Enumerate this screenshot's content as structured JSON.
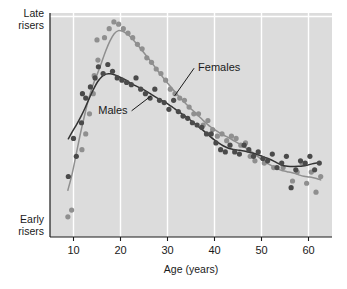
{
  "chart_data": {
    "type": "scatter",
    "title": "",
    "subtitle": "",
    "xlabel": "Age (years)",
    "ylabel": "",
    "xlim": [
      5,
      65
    ],
    "ylim": [
      0,
      100
    ],
    "xticks": [
      10,
      20,
      30,
      40,
      50,
      60
    ],
    "xticklabels": [
      "10",
      "20",
      "30",
      "40",
      "50",
      "60"
    ],
    "yticks": [],
    "yticklabels": [],
    "y_axis_top_label_line1": "Late",
    "y_axis_top_label_line2": "risers",
    "y_axis_bottom_label_line1": "Early",
    "y_axis_bottom_label_line2": "risers",
    "grid": "vertical-white-gridlines-at-xticks plus one horizontal gridline near top",
    "legend_position": "inline-annotations",
    "plot_background": "#dcdcdc",
    "gridline_color": "#ffffff",
    "axis_color": "#1a1a1a",
    "annotations": [
      {
        "name": "Females",
        "text": "Females",
        "x": 36.5,
        "y": 74,
        "leader_to_x": 31.5,
        "leader_to_y": 63
      },
      {
        "name": "Males",
        "text": "Males",
        "x": 21.5,
        "y": 55,
        "leader_to_x": 26.5,
        "leader_to_y": 63
      }
    ],
    "series": [
      {
        "name": "Females",
        "color": "#8f8f8f",
        "marker": "circle",
        "fit_curve_color": "#8f8f8f",
        "points": [
          {
            "x": 8.8,
            "y": 9
          },
          {
            "x": 9.6,
            "y": 12
          },
          {
            "x": 11.8,
            "y": 39
          },
          {
            "x": 12.6,
            "y": 46
          },
          {
            "x": 13.4,
            "y": 55
          },
          {
            "x": 14.2,
            "y": 64
          },
          {
            "x": 14.4,
            "y": 72
          },
          {
            "x": 15.2,
            "y": 79
          },
          {
            "x": 15.0,
            "y": 88
          },
          {
            "x": 16.6,
            "y": 89
          },
          {
            "x": 17.6,
            "y": 93
          },
          {
            "x": 18.6,
            "y": 96
          },
          {
            "x": 19.6,
            "y": 95
          },
          {
            "x": 20.6,
            "y": 93
          },
          {
            "x": 21.6,
            "y": 91
          },
          {
            "x": 22.6,
            "y": 89
          },
          {
            "x": 23.6,
            "y": 86
          },
          {
            "x": 24.6,
            "y": 84
          },
          {
            "x": 25.6,
            "y": 80
          },
          {
            "x": 26.6,
            "y": 78
          },
          {
            "x": 27.6,
            "y": 75
          },
          {
            "x": 28.6,
            "y": 73
          },
          {
            "x": 29.6,
            "y": 70
          },
          {
            "x": 30.6,
            "y": 66
          },
          {
            "x": 31.6,
            "y": 64
          },
          {
            "x": 32.6,
            "y": 62
          },
          {
            "x": 33.6,
            "y": 61
          },
          {
            "x": 34.6,
            "y": 58
          },
          {
            "x": 35.6,
            "y": 55
          },
          {
            "x": 36.6,
            "y": 55
          },
          {
            "x": 37.6,
            "y": 50
          },
          {
            "x": 38.6,
            "y": 52
          },
          {
            "x": 39.6,
            "y": 48
          },
          {
            "x": 40.6,
            "y": 45
          },
          {
            "x": 41.6,
            "y": 46
          },
          {
            "x": 42.6,
            "y": 43
          },
          {
            "x": 43.6,
            "y": 45
          },
          {
            "x": 44.6,
            "y": 44
          },
          {
            "x": 45.6,
            "y": 41
          },
          {
            "x": 46.6,
            "y": 42
          },
          {
            "x": 47.6,
            "y": 36
          },
          {
            "x": 48.6,
            "y": 34
          },
          {
            "x": 50.6,
            "y": 33
          },
          {
            "x": 52.6,
            "y": 31
          },
          {
            "x": 54.6,
            "y": 31
          },
          {
            "x": 56.6,
            "y": 25
          },
          {
            "x": 57.6,
            "y": 29
          },
          {
            "x": 58.6,
            "y": 33
          },
          {
            "x": 59.6,
            "y": 24
          },
          {
            "x": 60.6,
            "y": 29
          },
          {
            "x": 61.6,
            "y": 20
          },
          {
            "x": 62.6,
            "y": 27
          }
        ],
        "peak_age": 19.5,
        "peak_value": 96
      },
      {
        "name": "Males",
        "color": "#4a4a4a",
        "marker": "circle",
        "fit_curve_color": "#333333",
        "points": [
          {
            "x": 8.9,
            "y": 27
          },
          {
            "x": 10.6,
            "y": 36
          },
          {
            "x": 10.0,
            "y": 44
          },
          {
            "x": 11.7,
            "y": 51
          },
          {
            "x": 12.6,
            "y": 62
          },
          {
            "x": 11.9,
            "y": 64
          },
          {
            "x": 13.6,
            "y": 67
          },
          {
            "x": 14.6,
            "y": 71
          },
          {
            "x": 15.3,
            "y": 76
          },
          {
            "x": 16.3,
            "y": 73
          },
          {
            "x": 17.3,
            "y": 77
          },
          {
            "x": 18.3,
            "y": 74
          },
          {
            "x": 19.3,
            "y": 71
          },
          {
            "x": 20.3,
            "y": 70
          },
          {
            "x": 21.3,
            "y": 69
          },
          {
            "x": 22.3,
            "y": 68
          },
          {
            "x": 23.3,
            "y": 71
          },
          {
            "x": 24.3,
            "y": 66
          },
          {
            "x": 25.3,
            "y": 64
          },
          {
            "x": 26.3,
            "y": 62
          },
          {
            "x": 27.3,
            "y": 66
          },
          {
            "x": 28.3,
            "y": 61
          },
          {
            "x": 29.3,
            "y": 60
          },
          {
            "x": 30.3,
            "y": 57
          },
          {
            "x": 31.3,
            "y": 61
          },
          {
            "x": 32.3,
            "y": 56
          },
          {
            "x": 33.3,
            "y": 54
          },
          {
            "x": 34.3,
            "y": 53
          },
          {
            "x": 35.3,
            "y": 51
          },
          {
            "x": 36.3,
            "y": 50
          },
          {
            "x": 37.3,
            "y": 49
          },
          {
            "x": 38.3,
            "y": 46
          },
          {
            "x": 39.3,
            "y": 46
          },
          {
            "x": 40.3,
            "y": 42
          },
          {
            "x": 41.3,
            "y": 39
          },
          {
            "x": 42.3,
            "y": 38
          },
          {
            "x": 43.3,
            "y": 41
          },
          {
            "x": 44.3,
            "y": 38
          },
          {
            "x": 45.3,
            "y": 37
          },
          {
            "x": 46.3,
            "y": 41
          },
          {
            "x": 47.3,
            "y": 39
          },
          {
            "x": 48.3,
            "y": 36
          },
          {
            "x": 49.3,
            "y": 38
          },
          {
            "x": 50.3,
            "y": 35
          },
          {
            "x": 51.3,
            "y": 34
          },
          {
            "x": 52.3,
            "y": 37
          },
          {
            "x": 53.3,
            "y": 31
          },
          {
            "x": 54.3,
            "y": 33
          },
          {
            "x": 55.3,
            "y": 36
          },
          {
            "x": 56.3,
            "y": 22
          },
          {
            "x": 57.3,
            "y": 30
          },
          {
            "x": 58.3,
            "y": 34
          },
          {
            "x": 59.3,
            "y": 33
          },
          {
            "x": 60.3,
            "y": 36
          },
          {
            "x": 61.3,
            "y": 30
          },
          {
            "x": 62.3,
            "y": 33
          }
        ],
        "peak_age": 17,
        "peak_value": 78
      }
    ]
  },
  "axis": {
    "xlabel": "Age (years)",
    "xticklabels": [
      "10",
      "20",
      "30",
      "40",
      "50",
      "60"
    ],
    "late_risers_line1": "Late",
    "late_risers_line2": "risers",
    "early_risers_line1": "Early",
    "early_risers_line2": "risers"
  },
  "annotations": {
    "females_label": "Females",
    "males_label": "Males"
  },
  "colors": {
    "plot_bg": "#dcdcdc",
    "grid": "#ffffff",
    "axis": "#1a1a1a",
    "females": "#8f8f8f",
    "males": "#4a4a4a"
  }
}
